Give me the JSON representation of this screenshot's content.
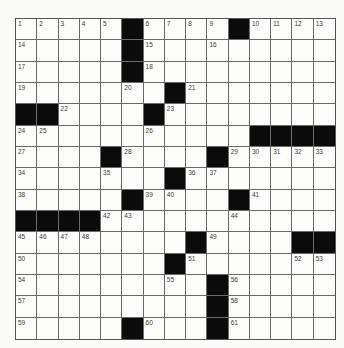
{
  "puzzle": {
    "rows": 15,
    "cols": 15,
    "grid": [
      [
        "1",
        "2",
        "3",
        "4",
        "5",
        "#",
        "6",
        "7",
        "8",
        "9",
        "#",
        "10",
        "11",
        "12",
        "13"
      ],
      [
        "14",
        "",
        "",
        "",
        "",
        "#",
        "15",
        "",
        "",
        "16",
        "",
        "",
        "",
        "",
        ""
      ],
      [
        "17",
        "",
        "",
        "",
        "",
        "#",
        "18",
        "",
        "",
        "",
        "",
        "",
        "",
        "",
        ""
      ],
      [
        "19",
        "",
        "",
        "",
        "",
        "20",
        "",
        "#",
        "21",
        "",
        "",
        "",
        "",
        "",
        ""
      ],
      [
        "#",
        "#",
        "22",
        "",
        "",
        "",
        "#",
        "23",
        "",
        "",
        "",
        "",
        "",
        "",
        ""
      ],
      [
        "24",
        "25",
        "",
        "",
        "",
        "",
        "26",
        "",
        "",
        "",
        "",
        "#",
        "#",
        "#",
        "#"
      ],
      [
        "27",
        "",
        "",
        "",
        "#",
        "28",
        "",
        "",
        "",
        "#",
        "29",
        "30",
        "31",
        "32",
        "33"
      ],
      [
        "34",
        "",
        "",
        "",
        "35",
        "",
        "",
        "#",
        "36",
        "37",
        "",
        "",
        "",
        "",
        ""
      ],
      [
        "38",
        "",
        "",
        "",
        "",
        "#",
        "39",
        "40",
        "",
        "",
        "#",
        "41",
        "",
        "",
        ""
      ],
      [
        "#",
        "#",
        "#",
        "#",
        "42",
        "43",
        "",
        "",
        "",
        "",
        "44",
        "",
        "",
        "",
        ""
      ],
      [
        "45",
        "46",
        "47",
        "48",
        "",
        "",
        "",
        "",
        "#",
        "49",
        "",
        "",
        "",
        "#",
        "#"
      ],
      [
        "50",
        "",
        "",
        "",
        "",
        "",
        "",
        "#",
        "51",
        "",
        "",
        "",
        "",
        "52",
        "53"
      ],
      [
        "54",
        "",
        "",
        "",
        "",
        "",
        "",
        "55",
        "",
        "#",
        "56",
        "",
        "",
        "",
        ""
      ],
      [
        "57",
        "",
        "",
        "",
        "",
        "",
        "",
        "",
        "",
        "#",
        "58",
        "",
        "",
        "",
        ""
      ],
      [
        "59",
        "",
        "",
        "",
        "",
        "#",
        "60",
        "",
        "",
        "#",
        "61",
        "",
        "",
        "",
        ""
      ]
    ]
  }
}
